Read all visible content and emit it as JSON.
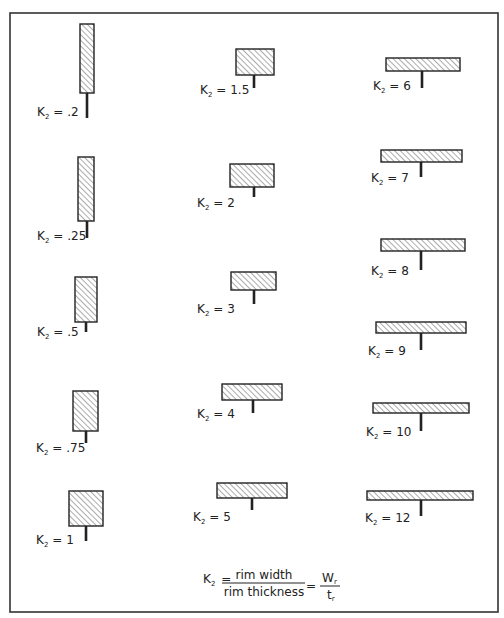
{
  "figure": {
    "label_prefix": "K",
    "label_subscript": "2",
    "hatch_color": "#444444",
    "line_color": "#222222",
    "sections": [
      {
        "label": ".2",
        "rect": [
          80,
          24,
          14,
          69
        ],
        "web": [
          87,
          93,
          118
        ],
        "text": [
          37,
          116
        ]
      },
      {
        "label": ".25",
        "rect": [
          78,
          157,
          16,
          64
        ],
        "web": [
          87,
          221,
          238
        ],
        "text": [
          37,
          240
        ]
      },
      {
        "label": ".5",
        "rect": [
          75,
          277,
          22,
          45
        ],
        "web": [
          86,
          322,
          332
        ],
        "text": [
          37,
          336
        ]
      },
      {
        "label": ".75",
        "rect": [
          73,
          391,
          25,
          40
        ],
        "web": [
          86,
          431,
          443
        ],
        "text": [
          36,
          452
        ]
      },
      {
        "label": "1",
        "rect": [
          69,
          491,
          34,
          35
        ],
        "web": [
          86,
          526,
          541
        ],
        "text": [
          36,
          544
        ]
      },
      {
        "label": "1.5",
        "rect": [
          236,
          49,
          38,
          26
        ],
        "web": [
          254,
          75,
          88
        ],
        "text": [
          200,
          94
        ]
      },
      {
        "label": "2",
        "rect": [
          230,
          164,
          44,
          23
        ],
        "web": [
          254,
          187,
          197
        ],
        "text": [
          197,
          207
        ]
      },
      {
        "label": "3",
        "rect": [
          231,
          272,
          45,
          18
        ],
        "web": [
          254,
          290,
          304
        ],
        "text": [
          197,
          313
        ]
      },
      {
        "label": "4",
        "rect": [
          222,
          384,
          60,
          16
        ],
        "web": [
          253,
          400,
          413
        ],
        "text": [
          197,
          418
        ]
      },
      {
        "label": "5",
        "rect": [
          217,
          483,
          70,
          15
        ],
        "web": [
          252,
          498,
          510
        ],
        "text": [
          193,
          521
        ]
      },
      {
        "label": "6",
        "rect": [
          386,
          58,
          74,
          13
        ],
        "web": [
          422,
          71,
          88
        ],
        "text": [
          373,
          90
        ]
      },
      {
        "label": "7",
        "rect": [
          381,
          150,
          81,
          12
        ],
        "web": [
          421,
          162,
          177
        ],
        "text": [
          371,
          182
        ]
      },
      {
        "label": "8",
        "rect": [
          381,
          239,
          84,
          12
        ],
        "web": [
          421,
          251,
          270
        ],
        "text": [
          371,
          275
        ]
      },
      {
        "label": "9",
        "rect": [
          376,
          322,
          90,
          11
        ],
        "web": [
          421,
          333,
          350
        ],
        "text": [
          368,
          355
        ]
      },
      {
        "label": "10",
        "rect": [
          373,
          403,
          96,
          10
        ],
        "web": [
          421,
          413,
          431
        ],
        "text": [
          366,
          436
        ]
      },
      {
        "label": "12",
        "rect": [
          367,
          491,
          106,
          9
        ],
        "web": [
          421,
          500,
          516
        ],
        "text": [
          365,
          522
        ]
      }
    ],
    "formula": {
      "lhs": "K",
      "lhs_sub": "2",
      "equals": "=",
      "numerator": "rim width",
      "denominator": "rim thickness",
      "rhs_numerator": "W",
      "rhs_numerator_sub": "r",
      "rhs_denominator": "t",
      "rhs_denominator_sub": "r"
    }
  }
}
